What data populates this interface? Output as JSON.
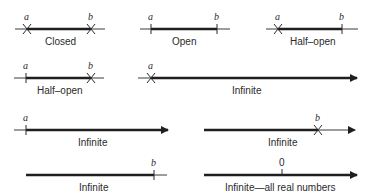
{
  "figure": {
    "intervals": [
      {
        "id": "closed",
        "label": "Closed",
        "left_mark": "a",
        "right_mark": "b",
        "left_end": "x",
        "right_end": "x"
      },
      {
        "id": "open",
        "label": "Open",
        "left_mark": "a",
        "right_mark": "b",
        "left_end": "tick",
        "right_end": "tick"
      },
      {
        "id": "half-open-1",
        "label": "Half–open",
        "left_mark": "a",
        "right_mark": "b",
        "left_end": "x",
        "right_end": "tick"
      },
      {
        "id": "half-open-2",
        "label": "Half–open",
        "left_mark": "a",
        "right_mark": "b",
        "left_end": "tick",
        "right_end": "x"
      },
      {
        "id": "infinite-1",
        "label": "Infinite",
        "left_mark": "a",
        "left_end": "x",
        "right_end": "arrow"
      },
      {
        "id": "infinite-2",
        "label": "Infinite",
        "left_mark": "a",
        "left_end": "tick",
        "right_end": "arrow"
      },
      {
        "id": "infinite-3",
        "label": "Infinite",
        "right_mark": "b",
        "right_end": "x",
        "direction": "left"
      },
      {
        "id": "infinite-4",
        "label": "Infinite",
        "right_mark": "b",
        "right_end": "tick",
        "direction": "left"
      },
      {
        "id": "all-reals",
        "label": "Infinite—all real numbers",
        "center_mark": "0",
        "right_end": "arrow"
      }
    ]
  },
  "colors": {
    "line": "#1f1f1f",
    "text": "#2a2a2a",
    "background": "#ffffff"
  }
}
